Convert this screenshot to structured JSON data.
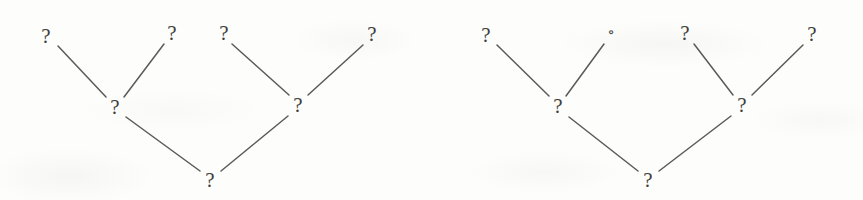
{
  "figure": {
    "background_color": "#fdfdfb",
    "ink_color": "#4a4a48",
    "edge_color": "#5a5a57",
    "width": 863,
    "height": 200
  },
  "chart_data": {
    "type": "diagram",
    "subtype": "binary-tree-pair",
    "title": "",
    "xlabel": "",
    "ylabel": "",
    "grid": false,
    "legend": null,
    "trees": [
      {
        "name": "left-tree",
        "root": "root",
        "nodes": [
          {
            "id": "L-leaf-1",
            "label": "?",
            "glyph": "question-mark",
            "x": 46,
            "y": 36,
            "depth": 2,
            "role": "leaf"
          },
          {
            "id": "L-leaf-2",
            "label": "?",
            "glyph": "question-mark",
            "x": 172,
            "y": 33,
            "depth": 2,
            "role": "leaf"
          },
          {
            "id": "L-leaf-3",
            "label": "?",
            "glyph": "question-mark",
            "x": 224,
            "y": 33,
            "depth": 2,
            "role": "leaf"
          },
          {
            "id": "L-leaf-4",
            "label": "?",
            "glyph": "question-mark",
            "x": 372,
            "y": 34,
            "depth": 2,
            "role": "leaf"
          },
          {
            "id": "L-mid-1",
            "label": "?",
            "glyph": "question-mark",
            "x": 115,
            "y": 107,
            "depth": 1,
            "role": "internal"
          },
          {
            "id": "L-mid-2",
            "label": "?",
            "glyph": "question-mark",
            "x": 298,
            "y": 105,
            "depth": 1,
            "role": "internal"
          },
          {
            "id": "L-root",
            "label": "?",
            "glyph": "question-mark",
            "x": 210,
            "y": 180,
            "depth": 0,
            "role": "root"
          }
        ],
        "edges": [
          {
            "from": "L-leaf-1",
            "to": "L-mid-1",
            "x1": 58,
            "y1": 46,
            "x2": 106,
            "y2": 97
          },
          {
            "from": "L-leaf-2",
            "to": "L-mid-1",
            "x1": 164,
            "y1": 44,
            "x2": 124,
            "y2": 97
          },
          {
            "from": "L-leaf-3",
            "to": "L-mid-2",
            "x1": 232,
            "y1": 44,
            "x2": 289,
            "y2": 95
          },
          {
            "from": "L-leaf-4",
            "to": "L-mid-2",
            "x1": 363,
            "y1": 45,
            "x2": 308,
            "y2": 95
          },
          {
            "from": "L-mid-1",
            "to": "L-root",
            "x1": 126,
            "y1": 117,
            "x2": 200,
            "y2": 171
          },
          {
            "from": "L-mid-2",
            "to": "L-root",
            "x1": 288,
            "y1": 116,
            "x2": 221,
            "y2": 171
          }
        ]
      },
      {
        "name": "right-tree",
        "root": "R-root",
        "nodes": [
          {
            "id": "R-leaf-1",
            "label": "?",
            "glyph": "question-mark",
            "x": 486,
            "y": 35,
            "depth": 2,
            "role": "leaf"
          },
          {
            "id": "R-leaf-2",
            "label": "∘",
            "glyph": "small-circle",
            "x": 611,
            "y": 32,
            "depth": 2,
            "role": "leaf"
          },
          {
            "id": "R-leaf-3",
            "label": "?",
            "glyph": "question-mark",
            "x": 685,
            "y": 33,
            "depth": 2,
            "role": "leaf"
          },
          {
            "id": "R-leaf-4",
            "label": "?",
            "glyph": "question-mark",
            "x": 812,
            "y": 34,
            "depth": 2,
            "role": "leaf"
          },
          {
            "id": "R-mid-1",
            "label": "?",
            "glyph": "question-mark",
            "x": 558,
            "y": 106,
            "depth": 1,
            "role": "internal"
          },
          {
            "id": "R-mid-2",
            "label": "?",
            "glyph": "question-mark",
            "x": 742,
            "y": 105,
            "depth": 1,
            "role": "internal"
          },
          {
            "id": "R-root",
            "label": "?",
            "glyph": "question-mark",
            "x": 648,
            "y": 180,
            "depth": 0,
            "role": "root"
          }
        ],
        "edges": [
          {
            "from": "R-leaf-1",
            "to": "R-mid-1",
            "x1": 497,
            "y1": 45,
            "x2": 549,
            "y2": 96
          },
          {
            "from": "R-leaf-2",
            "to": "R-mid-1",
            "x1": 604,
            "y1": 44,
            "x2": 566,
            "y2": 96
          },
          {
            "from": "R-leaf-3",
            "to": "R-mid-2",
            "x1": 694,
            "y1": 44,
            "x2": 733,
            "y2": 95
          },
          {
            "from": "R-leaf-4",
            "to": "R-mid-2",
            "x1": 803,
            "y1": 45,
            "x2": 752,
            "y2": 95
          },
          {
            "from": "R-mid-1",
            "to": "R-root",
            "x1": 569,
            "y1": 117,
            "x2": 638,
            "y2": 171
          },
          {
            "from": "R-mid-2",
            "to": "R-root",
            "x1": 731,
            "y1": 116,
            "x2": 659,
            "y2": 171
          }
        ]
      }
    ]
  }
}
